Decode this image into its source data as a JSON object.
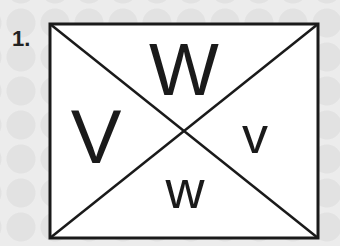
{
  "exercise": {
    "number": "1.",
    "letters": {
      "top": "W",
      "left": "V",
      "right": "v",
      "bottom": "w"
    }
  },
  "colors": {
    "stroke": "#1a1a1a",
    "box_fill": "#ffffff",
    "background": "#ececec"
  }
}
